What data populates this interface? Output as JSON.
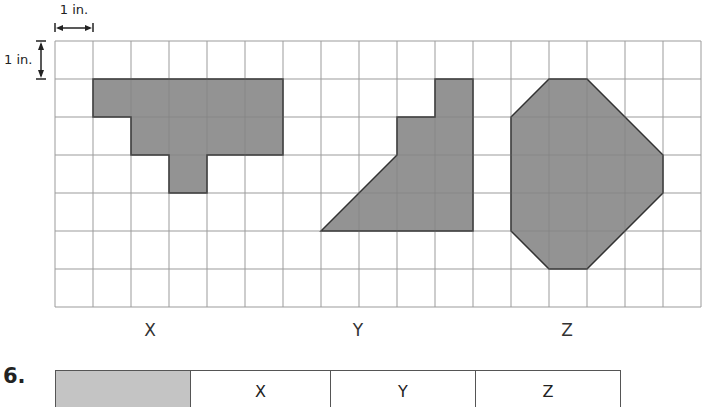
{
  "scale": {
    "horizontal_label": "1 in.",
    "vertical_label": "1 in."
  },
  "grid": {
    "origin_x": 55,
    "origin_y": 41,
    "cell_size_px": 38,
    "columns": 17,
    "rows": 7,
    "line_color": "#b5b5b5",
    "cell_unit": "1 in."
  },
  "shapes": [
    {
      "name": "X",
      "fill": "#8a8a8a",
      "vertices_grid_units": [
        [
          1,
          1
        ],
        [
          6,
          1
        ],
        [
          6,
          3
        ],
        [
          4,
          3
        ],
        [
          4,
          4
        ],
        [
          3,
          4
        ],
        [
          3,
          3
        ],
        [
          2,
          3
        ],
        [
          2,
          2
        ],
        [
          1,
          2
        ]
      ],
      "area_sq_in": 9
    },
    {
      "name": "Y",
      "fill": "#8a8a8a",
      "vertices_grid_units": [
        [
          7,
          5
        ],
        [
          9,
          3
        ],
        [
          9,
          2
        ],
        [
          10,
          2
        ],
        [
          10,
          1
        ],
        [
          11,
          1
        ],
        [
          11,
          5
        ]
      ],
      "area_sq_in": 13
    },
    {
      "name": "Z",
      "fill": "#8a8a8a",
      "vertices_grid_units": [
        [
          13,
          1
        ],
        [
          14,
          1
        ],
        [
          16,
          3
        ],
        [
          16,
          4
        ],
        [
          14,
          6
        ],
        [
          13,
          6
        ],
        [
          12,
          5
        ],
        [
          12,
          2
        ]
      ],
      "area_sq_in": 17
    }
  ],
  "labels": {
    "x": "X",
    "y": "Y",
    "z": "Z"
  },
  "question": {
    "number": "6."
  },
  "table": {
    "header_fill": "#c4c4c4",
    "columns": [
      {
        "label": "",
        "width": 134
      },
      {
        "label": "X",
        "width": 139
      },
      {
        "label": "Y",
        "width": 144
      },
      {
        "label": "Z",
        "width": 144
      }
    ]
  }
}
